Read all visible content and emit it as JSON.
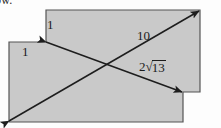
{
  "figure": {
    "title_fragment": "ow.",
    "shape": {
      "name": "stepped-rectangle",
      "fill_color": "#c9c9c9",
      "stroke_color": "#4a4a4a",
      "points": "46,10 200,10 200,92 183,92 183,122 9,122 9,42 46,42"
    },
    "arrows": {
      "stroke_color": "#1d1d1d",
      "diagonal_main": {
        "x1": 9,
        "y1": 121,
        "x2": 199,
        "y2": 11
      },
      "diagonal_cross": {
        "x1": 46,
        "y1": 42,
        "x2": 182,
        "y2": 92
      }
    },
    "labels": [
      {
        "id": "one-top",
        "text": "1"
      },
      {
        "id": "one-left",
        "text": "1"
      },
      {
        "id": "ten",
        "text": "10"
      },
      {
        "id": "radical",
        "coefficient": "2",
        "radical_symbol": "√",
        "radicand": "13",
        "text": "2√13"
      }
    ]
  }
}
